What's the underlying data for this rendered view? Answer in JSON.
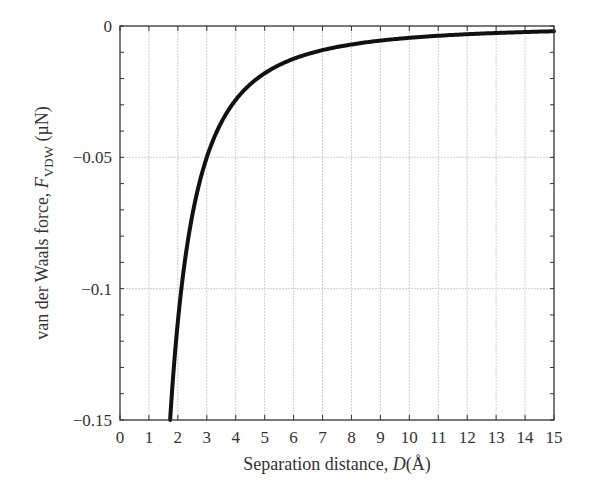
{
  "chart_data": {
    "type": "line",
    "title": "",
    "xlabel": "Separation distance, D(Å)",
    "ylabel": "van der Waals force, F_VDW (µN)",
    "xlim": [
      0,
      15
    ],
    "ylim": [
      -0.15,
      0
    ],
    "xticks": [
      0,
      1,
      2,
      3,
      4,
      5,
      6,
      7,
      8,
      9,
      10,
      11,
      12,
      13,
      14,
      15
    ],
    "yticks": [
      0,
      -0.05,
      -0.1,
      -0.15
    ],
    "ytick_labels": [
      "0",
      "−0.05",
      "−0.1",
      "−0.15"
    ],
    "grid": true,
    "series": [
      {
        "name": "F_VDW",
        "formula": "F = -0.45 / D^2",
        "x": [
          1.73,
          2,
          2.5,
          3,
          3.5,
          4,
          5,
          6,
          7,
          8,
          9,
          10,
          11,
          12,
          13,
          14,
          15
        ],
        "values": [
          -0.15,
          -0.1125,
          -0.072,
          -0.05,
          -0.0367,
          -0.0281,
          -0.018,
          -0.0125,
          -0.0092,
          -0.007,
          -0.0056,
          -0.0045,
          -0.0037,
          -0.0031,
          -0.0027,
          -0.0023,
          -0.002
        ]
      }
    ]
  },
  "labels": {
    "xlabel_text": "Separation distance, ",
    "xlabel_var": "D",
    "xlabel_unit": "(Å)",
    "ylabel_text": "van der Waals force, ",
    "ylabel_var": "F",
    "ylabel_sub": "VDW",
    "ylabel_unit": " (µN)"
  }
}
